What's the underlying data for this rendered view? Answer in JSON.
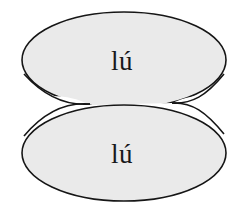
{
  "figure": {
    "type": "diagram",
    "background_color": "#ffffff"
  },
  "style": {
    "fill_color": "#eaeaea",
    "stroke_color": "#161616",
    "stroke_width": 1.6,
    "text_color": "#18181a"
  },
  "shapes": [
    {
      "name": "upper-ellipse",
      "label": "lú",
      "center_x": 124,
      "center_y": 60,
      "radius_x": 102,
      "radius_y": 48,
      "label_x": 122,
      "label_y": 70
    },
    {
      "name": "lower-ellipse",
      "label": "lú",
      "center_x": 124,
      "center_y": 153,
      "radius_x": 102,
      "radius_y": 48,
      "label_x": 122,
      "label_y": 163
    }
  ],
  "waist": {
    "left_x": 90,
    "right_x": 172,
    "y": 104
  }
}
